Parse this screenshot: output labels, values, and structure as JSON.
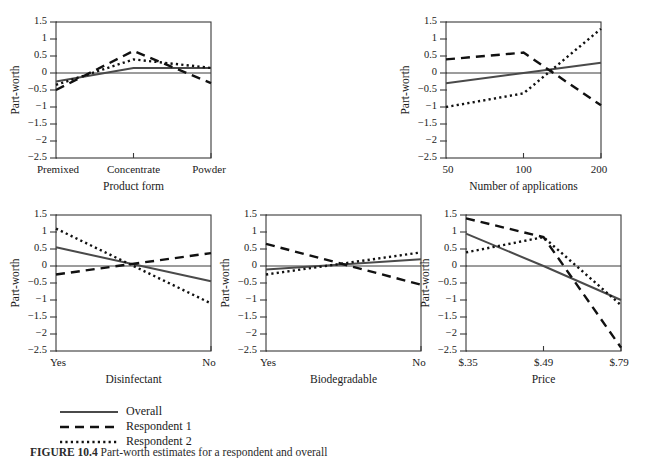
{
  "figure": {
    "caption_label": "FIGURE 10.4",
    "caption_text": "Part-worth estimates for a respondent and overall",
    "y_axis_title": "Part-worth"
  },
  "legend": {
    "items": [
      {
        "label": "Overall",
        "style": "solid",
        "series": "overall"
      },
      {
        "label": "Respondent 1",
        "style": "dashed",
        "series": "r1"
      },
      {
        "label": "Respondent 2",
        "style": "dotted",
        "series": "r2"
      }
    ]
  },
  "y_ticks": [
    "1.5",
    "1",
    "0.5",
    "0",
    "−0.5",
    "−1",
    "−1.5",
    "−2",
    "−2.5"
  ],
  "y_tick_values": [
    1.5,
    1,
    0.5,
    0,
    -0.5,
    -1,
    -1.5,
    -2,
    -2.5
  ],
  "chart_data": [
    {
      "id": "product-form",
      "type": "line",
      "title": "",
      "xlabel": "Product form",
      "ylabel": "Part-worth",
      "categories": [
        "Premixed",
        "Concentrate",
        "Powder"
      ],
      "x": [
        0,
        1,
        2
      ],
      "ylim": [
        -2.5,
        1.5
      ],
      "xlim": [
        0,
        2
      ],
      "grid": false,
      "series": [
        {
          "name": "Overall",
          "values": [
            -0.25,
            0.15,
            0.15
          ]
        },
        {
          "name": "Respondent 1",
          "values": [
            -0.5,
            0.65,
            -0.3
          ]
        },
        {
          "name": "Respondent 2",
          "values": [
            -0.35,
            0.4,
            0.15
          ]
        }
      ]
    },
    {
      "id": "number-of-applications",
      "type": "line",
      "title": "",
      "xlabel": "Number of applications",
      "ylabel": "Part-worth",
      "categories": [
        "50",
        "100",
        "200"
      ],
      "x": [
        0,
        1,
        2
      ],
      "ylim": [
        -2.5,
        1.5
      ],
      "xlim": [
        0,
        2
      ],
      "grid": false,
      "series": [
        {
          "name": "Overall",
          "values": [
            -0.3,
            0.0,
            0.3
          ]
        },
        {
          "name": "Respondent 1",
          "values": [
            0.4,
            0.6,
            -0.95
          ]
        },
        {
          "name": "Respondent 2",
          "values": [
            -1.0,
            -0.6,
            1.3
          ]
        }
      ]
    },
    {
      "id": "disinfectant",
      "type": "line",
      "title": "",
      "xlabel": "Disinfectant",
      "ylabel": "Part-worth",
      "categories": [
        "Yes",
        "No"
      ],
      "x": [
        0,
        1
      ],
      "ylim": [
        -2.5,
        1.5
      ],
      "xlim": [
        0,
        1
      ],
      "grid": false,
      "series": [
        {
          "name": "Overall",
          "values": [
            0.55,
            -0.45
          ]
        },
        {
          "name": "Respondent 1",
          "values": [
            -0.25,
            0.38
          ]
        },
        {
          "name": "Respondent 2",
          "values": [
            1.1,
            -1.1
          ]
        }
      ]
    },
    {
      "id": "biodegradable",
      "type": "line",
      "title": "",
      "xlabel": "Biodegradable",
      "ylabel": "Part-worth",
      "categories": [
        "Yes",
        "No"
      ],
      "x": [
        0,
        1
      ],
      "ylim": [
        -2.5,
        1.5
      ],
      "xlim": [
        0,
        1
      ],
      "grid": false,
      "series": [
        {
          "name": "Overall",
          "values": [
            -0.1,
            0.2
          ]
        },
        {
          "name": "Respondent 1",
          "values": [
            0.65,
            -0.55
          ]
        },
        {
          "name": "Respondent 2",
          "values": [
            -0.25,
            0.4
          ]
        }
      ]
    },
    {
      "id": "price",
      "type": "line",
      "title": "",
      "xlabel": "Price",
      "ylabel": "Part-worth",
      "categories": [
        "$.35",
        "$.49",
        "$.79"
      ],
      "x": [
        0,
        1,
        2
      ],
      "ylim": [
        -2.5,
        1.5
      ],
      "xlim": [
        0,
        2
      ],
      "grid": false,
      "series": [
        {
          "name": "Overall",
          "values": [
            0.95,
            0.0,
            -1.0
          ]
        },
        {
          "name": "Respondent 1",
          "values": [
            1.4,
            0.85,
            -2.4
          ]
        },
        {
          "name": "Respondent 2",
          "values": [
            0.4,
            0.85,
            -1.15
          ]
        }
      ]
    }
  ],
  "panel_layout": [
    {
      "id": "product-form",
      "left": 8,
      "top": 10,
      "plot_w": 155,
      "plot_h": 136
    },
    {
      "id": "number-of-applications",
      "left": 398,
      "top": 10,
      "plot_w": 155,
      "plot_h": 136
    },
    {
      "id": "disinfectant",
      "left": 8,
      "top": 203,
      "plot_w": 155,
      "plot_h": 136
    },
    {
      "id": "biodegradable",
      "left": 218,
      "top": 203,
      "plot_w": 155,
      "plot_h": 136
    },
    {
      "id": "price",
      "left": 418,
      "top": 203,
      "plot_w": 155,
      "plot_h": 136
    }
  ]
}
